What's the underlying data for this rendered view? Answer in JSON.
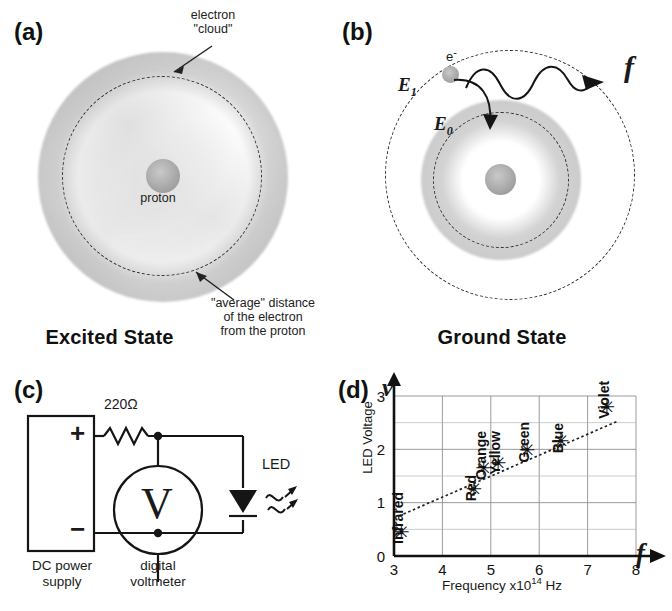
{
  "figure": {
    "panels": {
      "a": "(a)",
      "b": "(b)",
      "c": "(c)",
      "d": "(d)"
    }
  },
  "panel_a": {
    "label": "(a)",
    "caption": "Excited State",
    "annotation_cloud_line1": "electron",
    "annotation_cloud_line2": "\"cloud\"",
    "proton_label": "proton",
    "annotation_avg_line1": "\"average\" distance",
    "annotation_avg_line2": "of the electron",
    "annotation_avg_line3": "from the proton"
  },
  "panel_b": {
    "label": "(b)",
    "caption": "Ground State",
    "electron_label": "e",
    "electron_charge": "-",
    "energy_high": "E",
    "energy_high_sub": "1",
    "energy_low": "E",
    "energy_low_sub": "0",
    "frequency_symbol": "f"
  },
  "panel_c": {
    "label": "(c)",
    "resistor_label": "220Ω",
    "plus_terminal": "+",
    "minus_terminal": "−",
    "supply_line1": "DC power",
    "supply_line2": "supply",
    "meter_symbol": "V",
    "meter_line1": "digital",
    "meter_line2": "voltmeter",
    "led_label": "LED"
  },
  "panel_d": {
    "label": "(d)",
    "y_axis_symbol": "v",
    "x_axis_symbol": "f"
  },
  "chart_data": {
    "type": "scatter",
    "title": "",
    "xlabel": "Frequency x10¹⁴ Hz",
    "xlabel_parts": {
      "pre": "Frequency x10",
      "sup": "14",
      "post": " Hz"
    },
    "ylabel": "LED Voltage",
    "xlim": [
      3,
      8
    ],
    "ylim": [
      0,
      3
    ],
    "xticks": [
      3,
      4,
      5,
      6,
      7,
      8
    ],
    "yticks": [
      0,
      1,
      2,
      3
    ],
    "y_minor_gridlines": [
      0.5,
      1.5,
      2.5
    ],
    "grid": true,
    "legend": "none",
    "points": [
      {
        "label": "Infrared",
        "x": 3.15,
        "y": 0.45
      },
      {
        "label": "Red",
        "x": 4.65,
        "y": 1.25
      },
      {
        "label": "Orange",
        "x": 4.85,
        "y": 1.65
      },
      {
        "label": "Yellow",
        "x": 5.15,
        "y": 1.75
      },
      {
        "label": "Green",
        "x": 5.75,
        "y": 1.98
      },
      {
        "label": "Blue",
        "x": 6.45,
        "y": 2.15
      },
      {
        "label": "Violet",
        "x": 7.4,
        "y": 2.8
      }
    ],
    "fit_line": {
      "x_start": 3.1,
      "y_start": 0.75,
      "x_end": 7.6,
      "y_end": 2.52
    }
  }
}
